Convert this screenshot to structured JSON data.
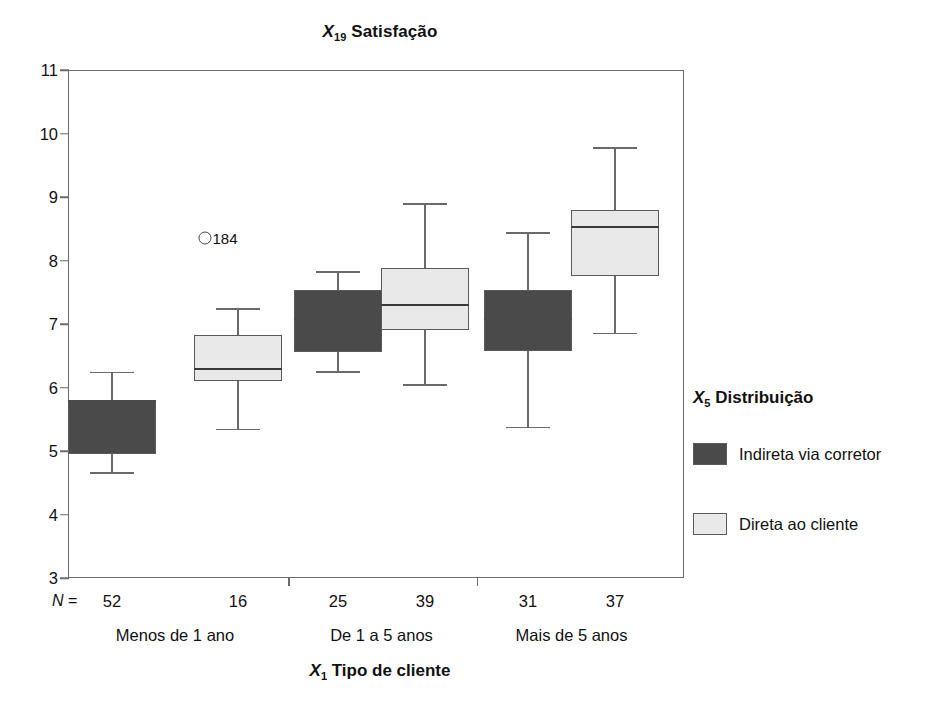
{
  "chart_data": {
    "type": "box",
    "title": "X19 Satisfação",
    "title_var": "X",
    "title_sub": "19",
    "title_rest": " Satisfação",
    "xlabel": "X1 Tipo de cliente",
    "xlabel_var": "X",
    "xlabel_sub": "1",
    "xlabel_rest": " Tipo de cliente",
    "ylabel": "",
    "ylim": [
      3,
      11
    ],
    "yticks": [
      11,
      10,
      9,
      8,
      7,
      6,
      5,
      4,
      3
    ],
    "grid": false,
    "legend_position": "right",
    "legend_title": "X5 Distribuição",
    "legend_title_var": "X",
    "legend_title_sub": "5",
    "legend_title_rest": " Distribuição",
    "n_prefix": "N =",
    "categories": [
      "Menos de 1 ano",
      "De 1 a 5 anos",
      "Mais de 5 anos"
    ],
    "series": [
      {
        "name": "Indireta via corretor",
        "color": "#4a4a4a",
        "boxes": [
          {
            "category": "Menos de 1 ano",
            "n": 52,
            "whisker_low": 4.67,
            "q1": 4.95,
            "median": 5.8,
            "q3": 5.8,
            "whisker_high": 6.25
          },
          {
            "category": "De 1 a 5 anos",
            "n": 25,
            "whisker_low": 6.26,
            "q1": 6.56,
            "median": 7.1,
            "q3": 7.53,
            "whisker_high": 7.83
          },
          {
            "category": "Mais de 5 anos",
            "n": 31,
            "whisker_low": 5.38,
            "q1": 6.57,
            "median": 7.1,
            "q3": 7.53,
            "whisker_high": 8.45
          }
        ]
      },
      {
        "name": "Direta ao cliente",
        "color": "#e9e9e9",
        "boxes": [
          {
            "category": "Menos de 1 ano",
            "n": 16,
            "whisker_low": 5.35,
            "q1": 6.1,
            "median": 6.3,
            "q3": 6.83,
            "whisker_high": 7.25
          },
          {
            "category": "De 1 a 5 anos",
            "n": 39,
            "whisker_low": 6.05,
            "q1": 6.9,
            "median": 7.32,
            "q3": 7.88,
            "whisker_high": 8.9
          },
          {
            "category": "Mais de 5 anos",
            "n": 37,
            "whisker_low": 6.86,
            "q1": 7.76,
            "median": 8.55,
            "q3": 8.8,
            "whisker_high": 9.78
          }
        ]
      }
    ],
    "outliers": [
      {
        "label": "184",
        "value": 8.35,
        "group_index": 0,
        "series_index": 1
      }
    ],
    "n_row": [
      52,
      16,
      25,
      39,
      31,
      37
    ]
  },
  "axis": {
    "y_tick_labels": [
      "11",
      "10",
      "9",
      "8",
      "7",
      "6",
      "5",
      "4",
      "3"
    ]
  },
  "legend": {
    "items": [
      {
        "label": "Indireta via corretor",
        "color": "#4a4a4a"
      },
      {
        "label": "Direta ao cliente",
        "color": "#e9e9e9"
      }
    ]
  }
}
